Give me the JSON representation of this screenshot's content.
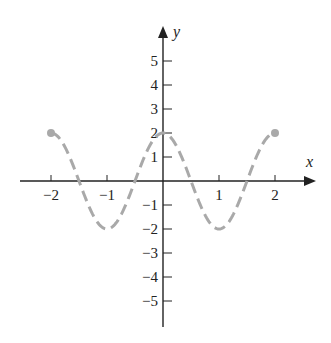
{
  "chart_data": {
    "type": "line",
    "title": "",
    "xlabel": "x",
    "ylabel": "y",
    "xlim": [
      -2.5,
      2.8
    ],
    "ylim": [
      -6,
      6
    ],
    "x_ticks": [
      -2,
      -1,
      1,
      2
    ],
    "x_tick_labels": [
      "−2",
      "−1",
      "1",
      "2"
    ],
    "y_ticks": [
      5,
      4,
      3,
      2,
      1,
      -1,
      -2,
      -3,
      -4,
      -5
    ],
    "y_tick_labels": [
      "5",
      "4",
      "3",
      "2",
      "1",
      "−1",
      "−2",
      "−3",
      "−4",
      "−5"
    ],
    "grid": false,
    "legend": null,
    "series": [
      {
        "name": "y = 2cos(πx)",
        "style": "dashed",
        "color": "#a9a9a9",
        "domain": [
          -2,
          2
        ],
        "endpoints": "closed",
        "x": [
          -2,
          -1.5,
          -1,
          -0.5,
          0,
          0.5,
          1,
          1.5,
          2
        ],
        "y": [
          2,
          0,
          -2,
          0,
          2,
          0,
          -2,
          0,
          2
        ]
      }
    ]
  },
  "colors": {
    "axis": "#222222",
    "curve": "#a9a9a9"
  }
}
